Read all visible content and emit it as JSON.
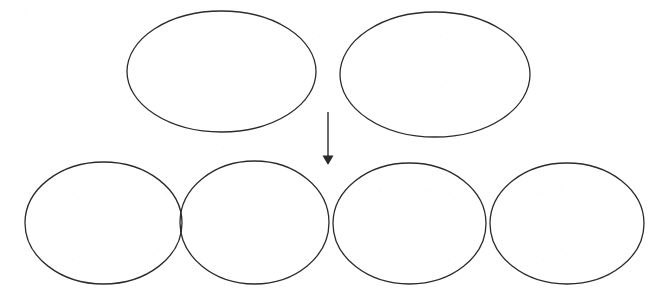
{
  "diagram": {
    "title": "",
    "canvas": {
      "width": 669,
      "height": 301
    },
    "background_color": "#ffffff",
    "stroke_color": "#2b2b2b",
    "stroke_width": 1.3,
    "fill_color": "none",
    "shape_type": "ellipse",
    "rows": [
      {
        "name": "top-row",
        "label": "",
        "count": 2,
        "shapes": [
          {
            "id": "top-ellipse-1",
            "label": "",
            "cx": 221.5,
            "cy": 71.5,
            "rx": 94.5,
            "ry": 60.5
          },
          {
            "id": "top-ellipse-2",
            "label": "",
            "cx": 435.0,
            "cy": 74.5,
            "rx": 95.0,
            "ry": 62.5
          }
        ]
      },
      {
        "name": "bottom-row",
        "label": "",
        "count": 4,
        "shapes": [
          {
            "id": "bottom-ellipse-1",
            "label": "",
            "cx": 103.5,
            "cy": 223.0,
            "rx": 78.5,
            "ry": 61.0
          },
          {
            "id": "bottom-ellipse-2",
            "label": "",
            "cx": 254.5,
            "cy": 222.5,
            "rx": 74.5,
            "ry": 61.5
          },
          {
            "id": "bottom-ellipse-3",
            "label": "",
            "cx": 409.5,
            "cy": 223.5,
            "rx": 76.5,
            "ry": 60.5
          },
          {
            "id": "bottom-ellipse-4",
            "label": "",
            "cx": 567.0,
            "cy": 223.5,
            "rx": 77.0,
            "ry": 60.5
          }
        ]
      }
    ],
    "arrow": {
      "id": "down-arrow",
      "label": "",
      "direction": "down",
      "x": 328,
      "y_start": 112,
      "y_end": 165,
      "head_width": 11,
      "head_height": 11,
      "color": "#2b2b2b"
    }
  }
}
